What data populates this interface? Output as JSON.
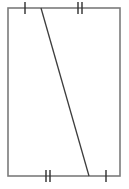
{
  "figure": {
    "name": "rectangle-with-diagonal-transversal",
    "canvas": {
      "width": 129,
      "height": 189,
      "background": "#ffffff"
    },
    "colors": {
      "rectangle_stroke": "#7b7b7b",
      "diagonal_stroke": "#3c3c3c",
      "tick_stroke": "#2e2e2e"
    },
    "strokes": {
      "rectangle_width": 1.6,
      "diagonal_width": 1.3,
      "tick_width": 1.4
    },
    "rectangle": {
      "label": "rectangle-outline",
      "x": 8,
      "y": 8,
      "width": 112,
      "height": 168,
      "corners": {
        "top_left": [
          8,
          8
        ],
        "top_right": [
          120,
          8
        ],
        "bottom_right": [
          120,
          176
        ],
        "bottom_left": [
          8,
          176
        ]
      }
    },
    "diagonal": {
      "label": "diagonal-transversal",
      "x1": 41,
      "y1": 8,
      "x2": 89,
      "y2": 176
    },
    "tick_marks": [
      {
        "name": "tick-top-left-single",
        "edge": "top",
        "count": 1,
        "center_x": 25,
        "center_y": 8,
        "half_length": 6,
        "spacing": 4
      },
      {
        "name": "tick-top-right-double",
        "edge": "top",
        "count": 2,
        "center_x": 80,
        "center_y": 8,
        "half_length": 6,
        "spacing": 4
      },
      {
        "name": "tick-bottom-left-double",
        "edge": "bottom",
        "count": 2,
        "center_x": 48,
        "center_y": 176,
        "half_length": 6,
        "spacing": 4
      },
      {
        "name": "tick-bottom-right-single",
        "edge": "bottom",
        "count": 1,
        "center_x": 106,
        "center_y": 176,
        "half_length": 6,
        "spacing": 4
      }
    ]
  }
}
